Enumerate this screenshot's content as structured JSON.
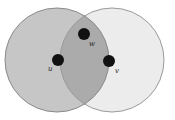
{
  "diagram": {
    "type": "venn",
    "circles": [
      {
        "id": "left",
        "cx": 57,
        "cy": 60,
        "r": 52,
        "fill": "#c6c6c6",
        "stroke": "#8a8a8a"
      },
      {
        "id": "right",
        "cx": 112,
        "cy": 60,
        "r": 52,
        "fill": "#ececec",
        "stroke": "#9a9a9a"
      }
    ],
    "overlap_fill": "#ababab",
    "nodes": [
      {
        "id": "u",
        "label": "u",
        "x": 58,
        "y": 60,
        "label_x": 48,
        "label_y": 71
      },
      {
        "id": "w",
        "label": "w",
        "x": 84,
        "y": 34,
        "label_x": 89,
        "label_y": 46
      },
      {
        "id": "v",
        "label": "v",
        "x": 109,
        "y": 61,
        "label_x": 115,
        "label_y": 73
      }
    ],
    "node_color": "#111111"
  }
}
